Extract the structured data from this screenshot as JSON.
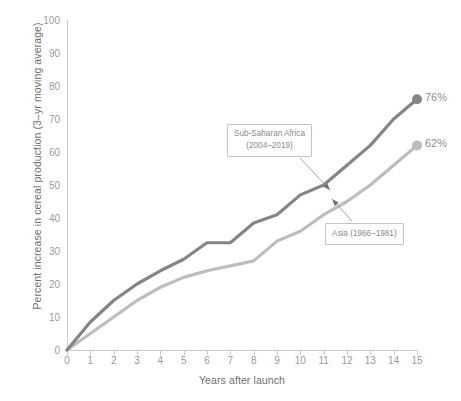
{
  "chart_data": {
    "type": "line",
    "title": "",
    "xlabel": "Years after launch",
    "ylabel": "Percent increase in cereal production (3–yr moving average)",
    "xlim": [
      0,
      15
    ],
    "ylim": [
      0,
      100
    ],
    "x": [
      0,
      1,
      2,
      3,
      4,
      5,
      6,
      7,
      8,
      9,
      10,
      11,
      12,
      13,
      14,
      15
    ],
    "xticks": [
      "0",
      "1",
      "2",
      "3",
      "4",
      "5",
      "6",
      "7",
      "8",
      "9",
      "10",
      "11",
      "12",
      "13",
      "14",
      "15"
    ],
    "yticks": [
      "0",
      "10",
      "20",
      "30",
      "40",
      "50",
      "60",
      "70",
      "80",
      "90",
      "100"
    ],
    "grid": false,
    "legend_position": "inline-annotations",
    "series": [
      {
        "name": "Sub-Saharan Africa (2004–2019)",
        "color": "#858585",
        "values": [
          0,
          8.5,
          15,
          20,
          24,
          27.5,
          32.5,
          32.5,
          38.5,
          41,
          47,
          50,
          56,
          62,
          70,
          76
        ],
        "end_label": "76%",
        "annotation": {
          "line1": "Sub-Saharan Africa",
          "line2": "(2004–2019)"
        }
      },
      {
        "name": "Asia (1966–1981)",
        "color": "#bdbdbd",
        "values": [
          0,
          5,
          10,
          15,
          19,
          22,
          24,
          25.5,
          27,
          33,
          36,
          41,
          45,
          50,
          56,
          62
        ],
        "end_label": "62%",
        "annotation": {
          "line1": "Asia (1966–1981)",
          "line2": ""
        }
      }
    ]
  }
}
